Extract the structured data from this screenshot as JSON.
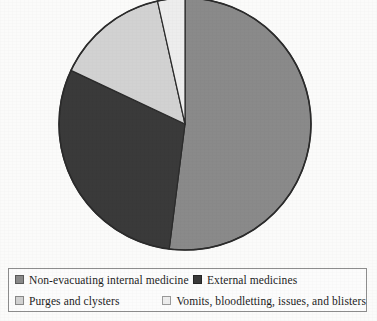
{
  "chart_data": {
    "type": "pie",
    "title": "",
    "subtitle": "",
    "xlabel": "",
    "ylabel": "",
    "legend_position": "bottom",
    "grid": false,
    "start_angle_deg": 0,
    "direction": "clockwise",
    "categories": [
      "Non-evacuating internal medicine",
      "External medicines",
      "Purges and clysters",
      "Vomits, bloodletting, issues, and blisters"
    ],
    "values": [
      52.0,
      30.0,
      14.5,
      3.5
    ],
    "units": "percent",
    "colors": [
      "#8a8a8a",
      "#3a3a3a",
      "#d2d2d2",
      "#ededed"
    ],
    "slices": [
      {
        "label": "Non-evacuating internal medicine",
        "value": 52.0,
        "color": "#8a8a8a",
        "start_angle_deg": 0,
        "end_angle_deg": 187.2
      },
      {
        "label": "External medicines",
        "value": 30.0,
        "color": "#3a3a3a",
        "start_angle_deg": 187.2,
        "end_angle_deg": 295.2
      },
      {
        "label": "Purges and clysters",
        "value": 14.5,
        "color": "#d2d2d2",
        "start_angle_deg": 295.2,
        "end_angle_deg": 347.4
      },
      {
        "label": "Vomits, bloodletting, issues, and blisters",
        "value": 3.5,
        "color": "#ededed",
        "start_angle_deg": 347.4,
        "end_angle_deg": 360
      }
    ],
    "geometry": {
      "center_x": 185,
      "center_y": 124,
      "radius": 126,
      "outline_color": "#2b2b2b"
    }
  },
  "legend": {
    "rows": [
      [
        {
          "label": "Non-evacuating internal medicine",
          "color": "#8a8a8a"
        },
        {
          "label": "External medicines",
          "color": "#3a3a3a"
        }
      ],
      [
        {
          "label": "Purges and clysters",
          "color": "#d2d2d2"
        },
        {
          "label": "Vomits, bloodletting, issues, and blisters",
          "color": "#ededed"
        }
      ]
    ]
  }
}
